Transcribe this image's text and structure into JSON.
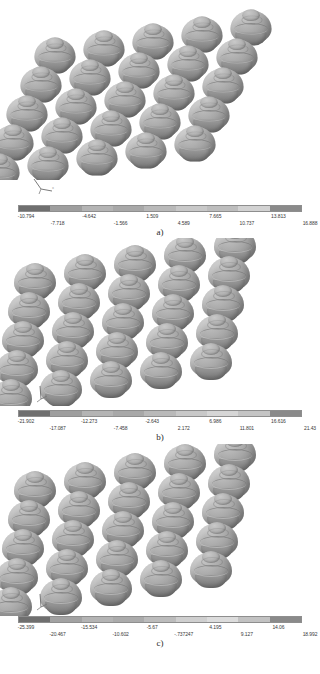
{
  "figure": {
    "caption": "",
    "background": "#ffffff"
  },
  "panels": [
    {
      "id": "a",
      "label": "a)",
      "triad_name": "axis-triad-icon",
      "dome_count": 25,
      "colorbar": {
        "name": "contour-legend-a",
        "colors": [
          "#6f6f6f",
          "#9e9e9e",
          "#b4b4b4",
          "#a8a8a8",
          "#b9b9b9",
          "#c8c8c8",
          "#bdbdbd",
          "#d2d2d2",
          "#8a8a8a"
        ],
        "labels_upper": [
          "-10.794",
          "-4.642",
          "1.509",
          "7.665",
          "13.813"
        ],
        "labels_lower": [
          "-7.718",
          "-1.566",
          "4.589",
          "10.737",
          "16.888"
        ],
        "min": "-10.794",
        "max": "16.888"
      }
    },
    {
      "id": "b",
      "label": "b)",
      "triad_name": "axis-triad-icon",
      "dome_count": 25,
      "colorbar": {
        "name": "contour-legend-b",
        "colors": [
          "#6f6f6f",
          "#9e9e9e",
          "#b4b4b4",
          "#a8a8a8",
          "#b9b9b9",
          "#c8c8c8",
          "#d6d6d6",
          "#c4c4c4",
          "#8a8a8a"
        ],
        "labels_upper": [
          "-21.902",
          "-12.273",
          "-2.643",
          "6.986",
          "16.616"
        ],
        "labels_lower": [
          "-17.087",
          "-7.458",
          "2.172",
          "11.801",
          "21.43"
        ],
        "min": "-21.902",
        "max": "21.43"
      }
    },
    {
      "id": "c",
      "label": "c)",
      "triad_name": "axis-triad-icon",
      "dome_count": 25,
      "colorbar": {
        "name": "contour-legend-c",
        "colors": [
          "#6f6f6f",
          "#a2a2a2",
          "#b4b4b4",
          "#ababab",
          "#bcbcbc",
          "#cfcfcf",
          "#dcdcdc",
          "#c2c2c2",
          "#8a8a8a"
        ],
        "labels_upper": [
          "-25.399",
          "-15.534",
          "-5.67",
          "4.195",
          "14.06"
        ],
        "labels_lower": [
          "-20.467",
          "-10.602",
          "-.737247",
          "9.127",
          "18.992"
        ],
        "min": "-25.399",
        "max": "18.992"
      }
    }
  ]
}
